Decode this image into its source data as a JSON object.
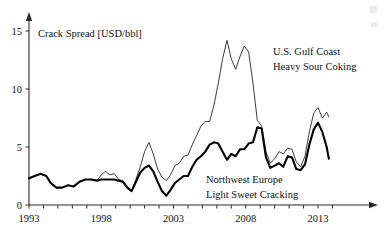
{
  "chart_data": {
    "type": "line",
    "title": "",
    "xlabel": "",
    "ylabel": "Crack Spread [USD/bbl]",
    "xlim": [
      1993,
      1993.25
    ],
    "ylim": [
      0,
      15
    ],
    "grid": false,
    "legend_position": "inline-annotations",
    "y_ticks": [
      0,
      5,
      10,
      15
    ],
    "y_tick_labels": [
      "0",
      "5",
      "10",
      "15"
    ],
    "x_ticks": [
      1993,
      1998,
      2003,
      2008,
      2013
    ],
    "x_tick_labels": [
      "1993",
      "1998",
      "2003",
      "2008",
      "2013"
    ],
    "x_minor_tick_interval": 1,
    "x_minor_ticks": [
      1993,
      1994,
      1995,
      1996,
      1997,
      1998,
      1999,
      2000,
      2001,
      2002,
      2003,
      2004,
      2005,
      2006,
      2007,
      2008,
      2009,
      2010,
      2011,
      2012,
      2013,
      2014
    ],
    "annotations": [
      {
        "name": "us-gulf-coast-label",
        "line1": "U.S. Gulf Coast",
        "line2": "Heavy Sour Coking",
        "series": "U.S. Gulf Coast Heavy Sour Coking"
      },
      {
        "name": "northwest-europe-label",
        "line1": "Northwest Europe",
        "line2": "Light Sweet Cracking",
        "series": "Northwest Europe Light Sweet Cracking"
      }
    ],
    "series": [
      {
        "name": "U.S. Gulf Coast Heavy Sour Coking",
        "style": "thin",
        "color": "#1a1a1a",
        "x": [
          1993.0,
          1993.4,
          1993.8,
          1994.2,
          1994.5,
          1994.9,
          1995.3,
          1995.7,
          1996.1,
          1996.5,
          1996.9,
          1997.3,
          1997.7,
          1998.0,
          1998.3,
          1998.6,
          1998.9,
          1999.2,
          1999.5,
          1999.8,
          2000.1,
          2000.4,
          2000.7,
          2001.0,
          2001.3,
          2001.6,
          2001.9,
          2002.2,
          2002.5,
          2002.8,
          2003.1,
          2003.4,
          2003.7,
          2004.0,
          2004.3,
          2004.6,
          2004.9,
          2005.2,
          2005.5,
          2005.8,
          2006.1,
          2006.4,
          2006.7,
          2007.0,
          2007.3,
          2007.6,
          2007.9,
          2008.2,
          2008.5,
          2008.8,
          2009.1,
          2009.4,
          2009.7,
          2010.0,
          2010.3,
          2010.6,
          2010.9,
          2011.2,
          2011.5,
          2011.8,
          2012.1,
          2012.4,
          2012.7,
          2013.0,
          2013.3,
          2013.6,
          2013.75
        ],
        "y": [
          2.3,
          2.5,
          2.7,
          2.5,
          1.9,
          1.5,
          1.5,
          1.7,
          1.6,
          2.0,
          2.2,
          2.2,
          2.1,
          2.6,
          2.9,
          2.6,
          2.7,
          2.2,
          2.1,
          1.6,
          1.2,
          2.2,
          3.3,
          4.6,
          5.4,
          4.4,
          3.1,
          2.4,
          2.1,
          2.6,
          3.4,
          3.6,
          4.2,
          4.3,
          5.2,
          6.0,
          6.8,
          7.2,
          7.2,
          8.6,
          10.5,
          12.6,
          14.2,
          12.6,
          11.7,
          12.8,
          13.7,
          13.2,
          10.5,
          7.3,
          6.8,
          4.6,
          3.6,
          4.0,
          4.6,
          4.4,
          4.9,
          4.8,
          3.7,
          3.3,
          4.2,
          6.3,
          7.9,
          8.4,
          7.5,
          8.0,
          7.6
        ]
      },
      {
        "name": "Northwest Europe Light Sweet Cracking",
        "style": "thick",
        "color": "#000000",
        "x": [
          1993.0,
          1993.4,
          1993.8,
          1994.2,
          1994.5,
          1994.9,
          1995.3,
          1995.7,
          1996.1,
          1996.5,
          1996.9,
          1997.3,
          1997.7,
          1998.0,
          1998.3,
          1998.6,
          1998.9,
          1999.2,
          1999.5,
          1999.8,
          2000.1,
          2000.4,
          2000.7,
          2001.0,
          2001.3,
          2001.6,
          2001.9,
          2002.2,
          2002.5,
          2002.8,
          2003.1,
          2003.4,
          2003.7,
          2004.0,
          2004.3,
          2004.6,
          2004.9,
          2005.2,
          2005.5,
          2005.8,
          2006.1,
          2006.4,
          2006.7,
          2007.0,
          2007.3,
          2007.6,
          2007.9,
          2008.2,
          2008.5,
          2008.8,
          2009.1,
          2009.4,
          2009.7,
          2010.0,
          2010.3,
          2010.6,
          2010.9,
          2011.2,
          2011.5,
          2011.8,
          2012.1,
          2012.4,
          2012.7,
          2013.0,
          2013.3,
          2013.6,
          2013.75
        ],
        "y": [
          2.3,
          2.5,
          2.7,
          2.5,
          1.9,
          1.5,
          1.5,
          1.7,
          1.6,
          2.0,
          2.2,
          2.2,
          2.1,
          2.2,
          2.2,
          2.2,
          2.2,
          2.1,
          2.0,
          1.5,
          1.2,
          2.0,
          2.8,
          3.2,
          3.4,
          2.9,
          2.0,
          1.2,
          0.8,
          1.3,
          1.9,
          2.2,
          2.5,
          2.5,
          3.3,
          3.9,
          4.2,
          4.6,
          5.2,
          5.4,
          5.3,
          4.6,
          3.9,
          4.4,
          4.2,
          4.8,
          4.8,
          5.3,
          5.4,
          6.7,
          6.6,
          4.1,
          3.2,
          3.4,
          3.6,
          3.3,
          4.2,
          4.1,
          3.1,
          3.0,
          3.5,
          5.2,
          6.5,
          7.1,
          6.3,
          5.0,
          4.0
        ]
      }
    ]
  }
}
